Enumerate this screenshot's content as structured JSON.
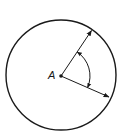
{
  "diagram": {
    "type": "circle-angle",
    "center_label": "A",
    "stroke_color": "#1a1a1a",
    "background": "#ffffff",
    "circle": {
      "cx": 61,
      "cy": 75,
      "r": 55
    },
    "center_point": {
      "x": 61,
      "y": 76
    },
    "radii": [
      {
        "name": "upper-radius",
        "x2": 92,
        "y2": 30
      },
      {
        "name": "lower-radius",
        "x2": 109,
        "y2": 97
      }
    ],
    "angle_arc": {
      "r": 29,
      "double_headed": true
    }
  }
}
